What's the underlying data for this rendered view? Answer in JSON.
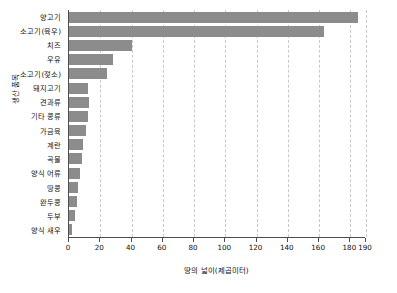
{
  "chart_data": {
    "type": "bar",
    "orientation": "horizontal",
    "title": "",
    "xlabel": "땅의 넓이(제곱미터)",
    "ylabel": "생산 품목",
    "xlim": [
      0,
      190
    ],
    "xticks": [
      0,
      20,
      40,
      60,
      80,
      100,
      120,
      140,
      160,
      180,
      190
    ],
    "xtick_labels": [
      "0",
      "20",
      "40",
      "60",
      "80",
      "100",
      "120",
      "140",
      "160",
      "180",
      "190"
    ],
    "grid": true,
    "grid_axis": "x",
    "legend": null,
    "bar_color": "#8c8c8c",
    "axis_color": "#4d4d4d",
    "grid_color": "#c9c9c9",
    "categories": [
      "양고기",
      "소고기(육우)",
      "치즈",
      "우유",
      "소고기(젖소)",
      "돼지고기",
      "견과류",
      "기타 콩류",
      "가금육",
      "계란",
      "곡물",
      "양식 어류",
      "땅콩",
      "완두콩",
      "두부",
      "양식 새우"
    ],
    "values": [
      185,
      163,
      40,
      28,
      24,
      12,
      13,
      12,
      11,
      9,
      8,
      7,
      6,
      5,
      4,
      2
    ]
  }
}
